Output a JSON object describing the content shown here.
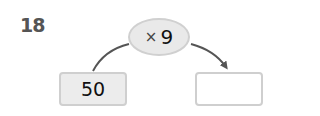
{
  "problem_number": "18",
  "operation": {
    "operator": "×",
    "operand": "9"
  },
  "input_box": {
    "value": "50"
  },
  "output_box": {
    "value": ""
  },
  "colors": {
    "arrow": "#555555",
    "box_fill": "#ececec",
    "border": "#cfcfcf"
  }
}
